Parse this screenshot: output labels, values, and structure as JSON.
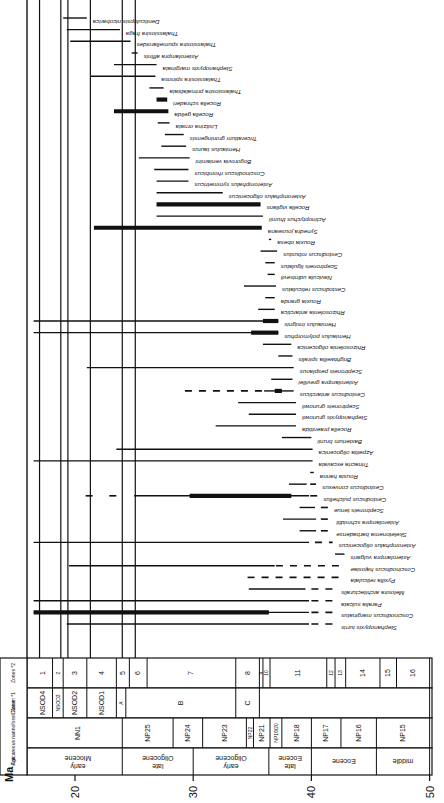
{
  "chart_data": {
    "type": "range-chart",
    "title": "",
    "orientation": "rotated 90 degrees; age axis horizontal, labels upside down",
    "xlabel": "Ma",
    "x_ticks": [
      20,
      30,
      40,
      50
    ],
    "xlim": [
      16.5,
      50
    ],
    "columns": {
      "age_header": "Age",
      "nanno_header": "Calcareous nannofossil Zone",
      "diatom_header": "Diatom *1",
      "zones_header": "Zones *2"
    },
    "ages": [
      {
        "label": "early Miocene",
        "from": 16.5,
        "to": 24.0
      },
      {
        "label": "late Oligocene",
        "from": 24.0,
        "to": 30.0
      },
      {
        "label": "early Oligocene",
        "from": 30.0,
        "to": 36.4
      },
      {
        "label": "late Eocene",
        "from": 36.4,
        "to": 40.0
      },
      {
        "label": "Eocene",
        "from": 40.0,
        "to": 45.5
      },
      {
        "label": "middle",
        "from": 45.5,
        "to": 50.0
      }
    ],
    "nanno_zones": [
      {
        "label": "NN1",
        "from": 16.5,
        "to": 24.0
      },
      {
        "label": "NP25",
        "from": 24.0,
        "to": 28.3
      },
      {
        "label": "NP24",
        "from": 28.3,
        "to": 30.8
      },
      {
        "label": "NP23",
        "from": 30.8,
        "to": 34.5
      },
      {
        "label": "NP22",
        "from": 34.5,
        "to": 35.1
      },
      {
        "label": "NP21",
        "from": 35.1,
        "to": 36.5
      },
      {
        "label": "NP19/20",
        "from": 36.5,
        "to": 37.5
      },
      {
        "label": "NP18",
        "from": 37.5,
        "to": 40.0
      },
      {
        "label": "NP17",
        "from": 40.0,
        "to": 42.5
      },
      {
        "label": "NP16",
        "from": 42.5,
        "to": 45.5
      },
      {
        "label": "NP15",
        "from": 45.5,
        "to": 50.0
      }
    ],
    "diatom_zones": [
      {
        "label": "NSOD4",
        "from": 16.5,
        "to": 18.1
      },
      {
        "label": "NSOD3",
        "from": 18.1,
        "to": 19.0
      },
      {
        "label": "NSOD2",
        "from": 19.0,
        "to": 21.0
      },
      {
        "label": "NSOD1",
        "from": 21.0,
        "to": 23.5
      },
      {
        "label": "A",
        "from": 23.5,
        "to": 24.3
      },
      {
        "label": "B",
        "from": 24.3,
        "to": 33.6
      },
      {
        "label": "C",
        "from": 33.6,
        "to": 35.6
      },
      {
        "label": "",
        "from": 35.6,
        "to": 50.0
      }
    ],
    "numbered_zones": [
      {
        "label": "1",
        "from": 16.5,
        "to": 18.1
      },
      {
        "label": "2",
        "from": 18.1,
        "to": 19.0
      },
      {
        "label": "3",
        "from": 19.0,
        "to": 21.0
      },
      {
        "label": "4",
        "from": 21.0,
        "to": 23.5
      },
      {
        "label": "5",
        "from": 23.5,
        "to": 24.6
      },
      {
        "label": "6",
        "from": 24.6,
        "to": 26.1
      },
      {
        "label": "7",
        "from": 26.1,
        "to": 33.6
      },
      {
        "label": "8",
        "from": 33.6,
        "to": 35.6
      },
      {
        "label": "9",
        "from": 35.6,
        "to": 35.9
      },
      {
        "label": "10",
        "from": 35.9,
        "to": 36.5
      },
      {
        "label": "11",
        "from": 36.5,
        "to": 41.3
      },
      {
        "label": "12",
        "from": 41.3,
        "to": 42.0
      },
      {
        "label": "13",
        "from": 42.0,
        "to": 42.9
      },
      {
        "label": "14",
        "from": 42.9,
        "to": 45.8
      },
      {
        "label": "15",
        "from": 45.8,
        "to": 47.2
      },
      {
        "label": "16",
        "from": 47.2,
        "to": 50.0
      }
    ],
    "boundary_lines_ma": [
      17.0,
      18.8,
      19.4,
      21.3,
      24.0,
      25.1
    ],
    "species": [
      {
        "name": "Denticulopsis nicobarica",
        "segments": [
          {
            "from": 19.0,
            "to": 21.0,
            "style": "solid"
          }
        ]
      },
      {
        "name": "Thalassiosira fraga",
        "segments": [
          {
            "from": 19.3,
            "to": 23.8,
            "style": "solid"
          }
        ]
      },
      {
        "name": "Thalassiosira spumellaroides",
        "segments": [
          {
            "from": 19.6,
            "to": 24.7,
            "style": "solid"
          }
        ]
      },
      {
        "name": "Asterolampra affinis",
        "segments": [
          {
            "from": 24.8,
            "to": 25.3,
            "style": "solid"
          }
        ]
      },
      {
        "name": "Stephanopyxis marginata",
        "segments": [
          {
            "from": 23.3,
            "to": 26.9,
            "style": "solid"
          }
        ]
      },
      {
        "name": "Thalassiosira spinosa",
        "segments": [
          {
            "from": 21.3,
            "to": 26.8,
            "style": "solid"
          }
        ]
      },
      {
        "name": "Thalassiosira primalabiata",
        "segments": [
          {
            "from": 26.3,
            "to": 27.5,
            "style": "solid"
          }
        ]
      },
      {
        "name": "Rocella schraderi",
        "segments": [
          {
            "from": 26.9,
            "to": 27.8,
            "style": "thick"
          }
        ]
      },
      {
        "name": "Rocella gelida",
        "segments": [
          {
            "from": 23.3,
            "to": 27.9,
            "style": "thick"
          }
        ]
      },
      {
        "name": "Lisitzina ornata",
        "segments": [
          {
            "from": 27.0,
            "to": 28.0,
            "style": "solid"
          }
        ]
      },
      {
        "name": "Triceratium groningensis",
        "segments": [
          {
            "from": 27.6,
            "to": 29.2,
            "style": "solid"
          }
        ]
      },
      {
        "name": "Hemiaulus taurus",
        "segments": [
          {
            "from": 27.3,
            "to": 29.4,
            "style": "solid"
          }
        ]
      },
      {
        "name": "Bogorovia veniamini",
        "segments": [
          {
            "from": 25.4,
            "to": 29.7,
            "style": "solid"
          }
        ]
      },
      {
        "name": "Coscinodiscus rhombicus",
        "segments": [
          {
            "from": 26.7,
            "to": 29.6,
            "style": "solid"
          }
        ]
      },
      {
        "name": "Asteromphalus symmetricus",
        "segments": [
          {
            "from": 26.9,
            "to": 29.6,
            "style": "solid"
          }
        ]
      },
      {
        "name": "Asteromphalus oligocenicus",
        "segments": [
          {
            "from": 26.9,
            "to": 32.5,
            "style": "solid"
          }
        ]
      },
      {
        "name": "Rocella vigilans",
        "segments": [
          {
            "from": 26.9,
            "to": 35.7,
            "style": "thick"
          }
        ]
      },
      {
        "name": "Actinoptychus thumii",
        "segments": [
          {
            "from": 26.9,
            "to": 35.9,
            "style": "solid"
          }
        ]
      },
      {
        "name": "Synedra jouseana",
        "segments": [
          {
            "from": 21.6,
            "to": 35.8,
            "style": "thick"
          }
        ]
      },
      {
        "name": "Rouxia obesa",
        "segments": [
          {
            "from": 36.4,
            "to": 36.6,
            "style": "solid"
          }
        ]
      },
      {
        "name": "Cestodiscus robustus",
        "segments": [
          {
            "from": 35.7,
            "to": 37.1,
            "style": "solid"
          }
        ]
      },
      {
        "name": "Sceptroneis ligulatus",
        "segments": [
          {
            "from": 36.1,
            "to": 36.9,
            "style": "solid"
          }
        ]
      },
      {
        "name": "Navicula udintsevii",
        "segments": [
          {
            "from": 36.3,
            "to": 36.9,
            "style": "solid"
          }
        ]
      },
      {
        "name": "Cestodiscus reticulatus",
        "segments": [
          {
            "from": 34.3,
            "to": 37.0,
            "style": "solid"
          }
        ]
      },
      {
        "name": "Rouxia granda",
        "segments": [
          {
            "from": 36.1,
            "to": 36.9,
            "style": "solid"
          }
        ]
      },
      {
        "name": "Rhizosolenia antarctica",
        "segments": [
          {
            "from": 35.5,
            "to": 36.9,
            "style": "solid"
          }
        ]
      },
      {
        "name": "Hemiaulus insignis",
        "segments": [
          {
            "from": 16.5,
            "to": 37.2,
            "style": "solid"
          },
          {
            "from": 35.9,
            "to": 37.2,
            "style": "thick"
          }
        ]
      },
      {
        "name": "Hemiaulus polymorphus",
        "segments": [
          {
            "from": 16.5,
            "to": 37.2,
            "style": "solid"
          },
          {
            "from": 34.9,
            "to": 37.2,
            "style": "thick"
          }
        ]
      },
      {
        "name": "Rhizosolenia oligocenica",
        "segments": [
          {
            "from": 35.9,
            "to": 38.3,
            "style": "solid"
          }
        ]
      },
      {
        "name": "Brightwellia spiralis",
        "segments": [
          {
            "from": 37.2,
            "to": 38.4,
            "style": "solid"
          }
        ]
      },
      {
        "name": "Sceptroneis pesplanus",
        "segments": [
          {
            "from": 21.0,
            "to": 38.5,
            "style": "solid"
          }
        ]
      },
      {
        "name": "Asterolampra grevillei",
        "segments": [
          {
            "from": 36.6,
            "to": 38.4,
            "style": "solid"
          }
        ]
      },
      {
        "name": "Cestodiscus antarcticus",
        "segments": [
          {
            "from": 29.3,
            "to": 36.0,
            "style": "dashed"
          },
          {
            "from": 36.0,
            "to": 38.5,
            "style": "solid"
          },
          {
            "from": 36.9,
            "to": 37.5,
            "style": "thick"
          }
        ]
      },
      {
        "name": "Sceptroneis grunowii",
        "segments": [
          {
            "from": 33.8,
            "to": 38.7,
            "style": "solid"
          }
        ]
      },
      {
        "name": "Stephanopyxis grunowii",
        "segments": [
          {
            "from": 34.7,
            "to": 38.7,
            "style": "solid"
          }
        ]
      },
      {
        "name": "Rocella praenitida",
        "segments": [
          {
            "from": 31.9,
            "to": 38.7,
            "style": "solid"
          }
        ]
      },
      {
        "name": "Baxterium brunii",
        "segments": [
          {
            "from": 37.5,
            "to": 40.0,
            "style": "solid"
          }
        ]
      },
      {
        "name": "Azpeitia oligocenica",
        "segments": [
          {
            "from": 23.5,
            "to": 40.1,
            "style": "solid"
          }
        ]
      },
      {
        "name": "Trinacria excavata",
        "segments": [
          {
            "from": 16.5,
            "to": 40.1,
            "style": "solid"
          }
        ]
      },
      {
        "name": "Rouxia hanna",
        "segments": [
          {
            "from": 39.9,
            "to": 40.2,
            "style": "solid"
          }
        ]
      },
      {
        "name": "Cestodiscus convexus",
        "segments": [
          {
            "from": 38.1,
            "to": 39.6,
            "style": "solid"
          },
          {
            "from": 39.9,
            "to": 40.4,
            "style": "dashed"
          }
        ]
      },
      {
        "name": "Cestodiscus pulchellus",
        "segments": [
          {
            "from": 20.9,
            "to": 21.9,
            "style": "dashed"
          },
          {
            "from": 22.9,
            "to": 24.0,
            "style": "dashed"
          },
          {
            "from": 25.0,
            "to": 39.8,
            "style": "solid"
          },
          {
            "from": 29.7,
            "to": 38.3,
            "style": "thick"
          },
          {
            "from": 39.9,
            "to": 40.5,
            "style": "dashed"
          }
        ]
      },
      {
        "name": "Sceptroneis tenue",
        "segments": [
          {
            "from": 39.0,
            "to": 40.3,
            "style": "solid"
          },
          {
            "from": 40.8,
            "to": 41.4,
            "style": "dashed"
          }
        ]
      },
      {
        "name": "Asterolampra schmidtii",
        "segments": [
          {
            "from": 37.6,
            "to": 40.4,
            "style": "solid"
          },
          {
            "from": 40.8,
            "to": 41.6,
            "style": "dashed"
          }
        ]
      },
      {
        "name": "Skeletonema barbadense",
        "segments": [
          {
            "from": 39.0,
            "to": 40.4,
            "style": "solid"
          },
          {
            "from": 40.8,
            "to": 41.6,
            "style": "dashed"
          }
        ]
      },
      {
        "name": "Asteromphalus oligocenicus (lower)",
        "segments": [
          {
            "from": 16.5,
            "to": 39.8,
            "style": "solid"
          },
          {
            "from": 40.3,
            "to": 41.8,
            "style": "dashed"
          }
        ]
      },
      {
        "name": "Asterolampra vulgaris",
        "segments": [
          {
            "from": 42.0,
            "to": 42.8,
            "style": "solid"
          }
        ]
      },
      {
        "name": "Coscinodiscus hajosiae",
        "segments": [
          {
            "from": 19.5,
            "to": 36.9,
            "style": "solid"
          },
          {
            "from": 37.0,
            "to": 42.8,
            "style": "dashed"
          }
        ]
      },
      {
        "name": "Pyxilla reticulata",
        "segments": [
          {
            "from": 34.6,
            "to": 42.8,
            "style": "dashed"
          }
        ]
      },
      {
        "name": "Melosira architecturalis",
        "segments": [
          {
            "from": 34.7,
            "to": 39.5,
            "style": "solid"
          },
          {
            "from": 40.0,
            "to": 42.0,
            "style": "dashed"
          }
        ]
      },
      {
        "name": "Paralia sulcata",
        "segments": [
          {
            "from": 16.5,
            "to": 39.8,
            "style": "solid"
          },
          {
            "from": 40.0,
            "to": 42.0,
            "style": "dashed"
          }
        ]
      },
      {
        "name": "Coscinodiscus marginatus",
        "segments": [
          {
            "from": 16.5,
            "to": 39.8,
            "style": "solid"
          },
          {
            "from": 16.5,
            "to": 36.4,
            "style": "thick"
          },
          {
            "from": 40.0,
            "to": 42.0,
            "style": "dashed"
          }
        ]
      },
      {
        "name": "Stephanopyxis turris",
        "segments": [
          {
            "from": 19.3,
            "to": 39.8,
            "style": "solid"
          },
          {
            "from": 40.0,
            "to": 42.0,
            "style": "dashed"
          }
        ]
      }
    ]
  }
}
